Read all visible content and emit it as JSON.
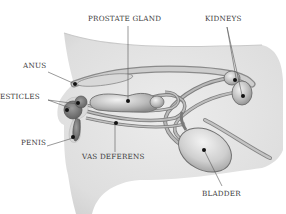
{
  "diagram": {
    "labels": {
      "prostate_gland": "PROSTATE GLAND",
      "kidneys": "KIDNEYS",
      "anus": "ANUS",
      "testicles": "ESTICLES",
      "penis": "PENIS",
      "vas_deferens": "VAS DEFERENS",
      "bladder": "BLADDER"
    },
    "colors": {
      "body_fill": "#e4e4e4",
      "body_shadow": "#cfcfcf",
      "organ_fill": "#c8c8c8",
      "organ_dark": "#8a8a8a",
      "organ_stroke": "#6a6a6a",
      "pointer_dot": "#111111",
      "leader_line": "#555555",
      "text": "#3a3a3a"
    }
  }
}
